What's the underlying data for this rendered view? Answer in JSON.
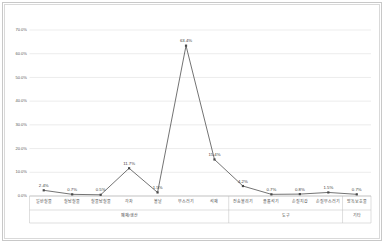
{
  "chart_data": {
    "type": "line",
    "title": "",
    "xlabel": "",
    "ylabel": "",
    "ylim": [
      0,
      70
    ],
    "ytick_labels": [
      "0.0%",
      "10.0%",
      "20.0%",
      "30.0%",
      "40.0%",
      "50.0%",
      "60.0%",
      "70.0%"
    ],
    "ytick_values": [
      0,
      10,
      20,
      30,
      40,
      50,
      60,
      70
    ],
    "grid": "horizontal",
    "legend": "none",
    "categories": [
      "일반철물",
      "철납철물",
      "철물납철물",
      "각자",
      "볼날",
      "부스러기",
      "석재",
      "전송불리기",
      "플롤석기",
      "손질지갑",
      "손질부스러기",
      "방독보호물"
    ],
    "values": [
      2.4,
      0.7,
      0.5,
      11.7,
      1.5,
      63.4,
      15.4,
      4.2,
      0.7,
      0.8,
      1.5,
      0.7
    ],
    "data_labels": [
      "2.4%",
      "0.7%",
      "0.5%",
      "11.7%",
      "1.5%",
      "63.4%",
      "15.4%",
      "4.2%",
      "0.7%",
      "0.8%",
      "1.5%",
      "0.7%"
    ],
    "groups": [
      {
        "label": "폐재/생산",
        "start": 0,
        "end": 6
      },
      {
        "label": "도구",
        "start": 7,
        "end": 10
      },
      {
        "label": "기타",
        "start": 11,
        "end": 11
      }
    ],
    "series_color": "#5a5a5a",
    "marker_color": "#4a4a4a",
    "grid_color": "#d9d9d9",
    "axis_color": "#b0b0b0"
  }
}
